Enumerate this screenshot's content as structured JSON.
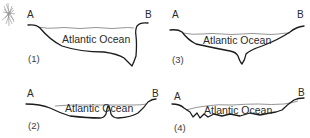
{
  "diagram": {
    "panels": [
      {
        "id": "1",
        "number_label": "(1)",
        "left_label": "A",
        "right_label": "B",
        "ocean_label": "Atlantic Ocean",
        "feature": "deep trench near B, steep eastern margin"
      },
      {
        "id": "2",
        "number_label": "(2)",
        "left_label": "A",
        "right_label": "B",
        "ocean_label": "Atlantic Ocean",
        "feature": "central ridge rising near middle"
      },
      {
        "id": "3",
        "number_label": "(3)",
        "left_label": "A",
        "right_label": "B",
        "ocean_label": "Atlantic Ocean",
        "feature": "central V-shaped trench"
      },
      {
        "id": "4",
        "number_label": "(4)",
        "left_label": "A",
        "right_label": "B",
        "ocean_label": "Atlantic Ocean",
        "feature": "irregular jagged floor"
      }
    ],
    "decoration": {
      "icon": "scribble-mark"
    },
    "colors": {
      "floor_line": "#1c1c1c",
      "surface_line": "#7a7a7a",
      "text": "#2a2a2a",
      "background": "#ffffff"
    }
  }
}
